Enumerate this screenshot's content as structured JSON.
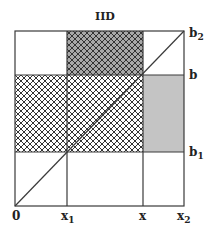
{
  "title": "IID",
  "axes": {
    "x_labels": [
      "0",
      "x",
      "x",
      "x"
    ],
    "x_label_subs": [
      "",
      "1",
      "",
      "2"
    ],
    "y_labels": [
      "b",
      "b",
      "b"
    ],
    "y_label_subs": [
      "2",
      "",
      "1"
    ]
  },
  "regions": {
    "top_middle": "cross-hatched dark",
    "middle_left": "cross-hatched light",
    "middle_center": "cross-hatched light",
    "middle_right": "gray shaded"
  },
  "colors": {
    "line": "#3a3a3a",
    "dark_fill": "#a8a8a8",
    "shade": "#c4c4c4"
  }
}
